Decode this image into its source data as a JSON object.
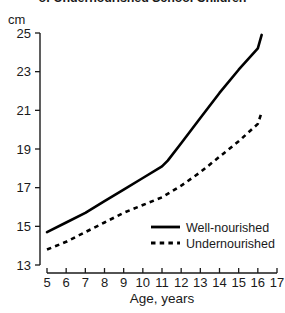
{
  "title": "of Undernourished School Children",
  "unit_label": "cm",
  "xlabel": "Age, years",
  "ylabel": "cm",
  "legend": {
    "well_nourished": "Well-nourished",
    "undernourished": "Undernourished"
  },
  "colors": {
    "line": "#000000",
    "text": "#1a1a1a",
    "background": "#ffffff"
  },
  "chart_data": {
    "type": "line",
    "title": "of Undernourished School Children",
    "xlabel": "Age, years",
    "ylabel": "cm",
    "xlim": [
      5,
      17
    ],
    "ylim": [
      13,
      25
    ],
    "xticks": [
      5,
      6,
      7,
      8,
      9,
      10,
      11,
      12,
      13,
      14,
      15,
      16,
      17
    ],
    "yticks": [
      13,
      15,
      17,
      19,
      21,
      23,
      25
    ],
    "xtick_labels": [
      "5",
      "6",
      "7",
      "8",
      "9",
      "10",
      "11",
      "12",
      "13",
      "14",
      "15",
      "16",
      "17"
    ],
    "ytick_labels": [
      "13",
      "15",
      "17",
      "19",
      "21",
      "23",
      "25"
    ],
    "grid": false,
    "legend_position": "inside lower right",
    "series": [
      {
        "name": "Well-nourished",
        "style": "solid",
        "x": [
          5,
          6,
          7,
          8,
          9,
          10,
          11,
          11.3,
          12,
          13,
          14,
          15,
          16,
          16.2
        ],
        "values": [
          14.7,
          15.2,
          15.7,
          16.3,
          16.9,
          17.5,
          18.1,
          18.4,
          19.3,
          20.6,
          21.9,
          23.1,
          24.2,
          24.9
        ]
      },
      {
        "name": "Undernourished",
        "style": "dashed",
        "x": [
          5,
          6,
          7,
          8,
          9,
          10,
          11,
          12,
          13,
          14,
          15,
          16,
          16.2
        ],
        "values": [
          13.8,
          14.2,
          14.7,
          15.2,
          15.7,
          16.1,
          16.5,
          17.1,
          17.8,
          18.6,
          19.4,
          20.3,
          20.9
        ]
      }
    ]
  }
}
